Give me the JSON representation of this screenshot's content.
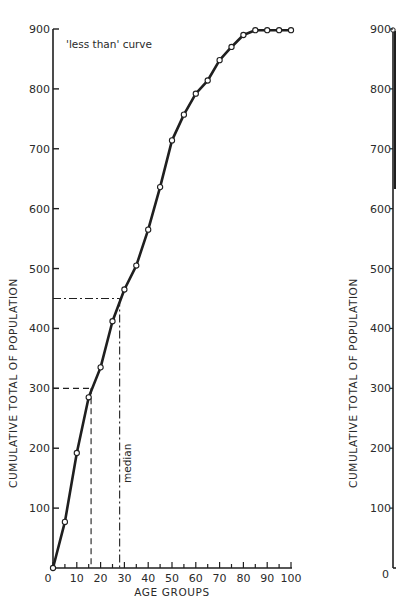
{
  "chart_data": [
    {
      "type": "line",
      "title": "",
      "annotation": "'less than' curve",
      "xlabel": "AGE GROUPS",
      "ylabel": "CUMULATIVE TOTAL OF POPULATION",
      "xlim": [
        0,
        100
      ],
      "ylim": [
        0,
        900
      ],
      "x_ticks": [
        0,
        10,
        20,
        30,
        40,
        50,
        60,
        70,
        80,
        90,
        100
      ],
      "x_minor_step": 5,
      "y_ticks": [
        100,
        200,
        300,
        400,
        500,
        600,
        700,
        800,
        900
      ],
      "x_tick_labels": [
        "0",
        "10",
        "20",
        "30",
        "40",
        "50",
        "60",
        "70",
        "80",
        "90",
        "100"
      ],
      "y_tick_labels": [
        "100",
        "200",
        "300",
        "400",
        "500",
        "600",
        "700",
        "800",
        "900"
      ],
      "grid": false,
      "legend": null,
      "series": [
        {
          "name": "less than curve",
          "marker": "open-circle",
          "x": [
            0,
            5,
            10,
            15,
            20,
            25,
            30,
            35,
            40,
            45,
            50,
            55,
            60,
            65,
            70,
            75,
            80,
            85,
            90,
            95,
            100
          ],
          "y": [
            0,
            77,
            192,
            285,
            335,
            412,
            465,
            505,
            565,
            636,
            714,
            757,
            792,
            814,
            848,
            870,
            890,
            898,
            898,
            898,
            898
          ]
        }
      ],
      "reference_lines": [
        {
          "style": "dashed",
          "y": 300,
          "x": 16,
          "label": ""
        },
        {
          "style": "dash-dot",
          "y": 450,
          "x": 28,
          "label": "median"
        }
      ]
    },
    {
      "type": "line",
      "title": "",
      "note": "partially visible second chart (cropped at right edge)",
      "ylabel": "CUMULATIVE TOTAL OF POPULATION",
      "ylim": [
        0,
        900
      ],
      "y_ticks": [
        0,
        100,
        200,
        300,
        400,
        500,
        600,
        700,
        800,
        900
      ],
      "y_tick_labels": [
        "0",
        "100",
        "200",
        "300",
        "400",
        "500",
        "600",
        "700",
        "800",
        "900"
      ],
      "series": [
        {
          "name": "partial curve",
          "x": [
            0
          ],
          "y": [
            900
          ]
        }
      ]
    }
  ],
  "labels": {
    "curve_annotation": "'less than' curve",
    "median": "median",
    "x_title": "AGE GROUPS",
    "y_title": "CUMULATIVE TOTAL OF POPULATION",
    "y_title_right": "CUMULATIVE TOTAL OF POPULATION",
    "right_zero": "0"
  }
}
